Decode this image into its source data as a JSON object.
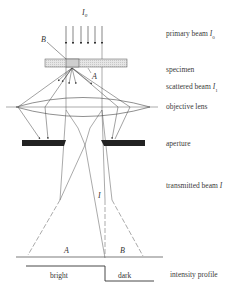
{
  "diagram": {
    "incident_label": "I",
    "incident_sub": "0",
    "point_b": "B",
    "point_a": "A",
    "transmitted_label": "I",
    "screen_a": "A",
    "screen_b": "B",
    "profile_bright": "bright",
    "profile_dark": "dark"
  },
  "labels": {
    "primary_beam": "primary beam",
    "primary_beam_sym": "I",
    "primary_beam_sub": "0",
    "specimen": "specimen",
    "scattered_beam": "scattered beam",
    "scattered_beam_sym": "I",
    "scattered_beam_sub": "1",
    "objective_lens": "objective lens",
    "aperture": "aperture",
    "transmitted_beam": "transmitted beam",
    "transmitted_beam_sym": "I",
    "intensity_profile": "intensity profile"
  }
}
